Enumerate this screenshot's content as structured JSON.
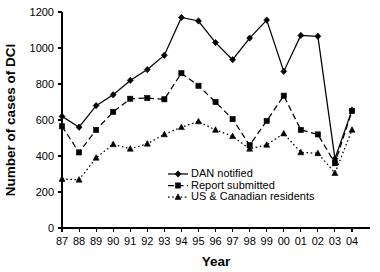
{
  "chart_data": {
    "type": "line",
    "title": "",
    "xlabel": "Year",
    "ylabel": "Number of cases of DCI",
    "categories": [
      "87",
      "88",
      "89",
      "90",
      "91",
      "92",
      "93",
      "94",
      "95",
      "96",
      "97",
      "98",
      "99",
      "00",
      "01",
      "02",
      "03",
      "04"
    ],
    "ylim": [
      0,
      1200
    ],
    "yticks": [
      0,
      200,
      400,
      600,
      800,
      1000,
      1200
    ],
    "grid": false,
    "legend_position": "inside-bottom-right",
    "series": [
      {
        "name": "DAN notified",
        "line_style": "solid",
        "marker": "diamond",
        "color": "#000000",
        "values": [
          620,
          560,
          680,
          740,
          820,
          880,
          960,
          1170,
          1150,
          1030,
          935,
          1055,
          1155,
          870,
          1070,
          1065,
          385,
          655
        ]
      },
      {
        "name": "Report submitted",
        "line_style": "dashed",
        "marker": "square",
        "color": "#000000",
        "values": [
          565,
          420,
          545,
          645,
          718,
          722,
          715,
          860,
          790,
          700,
          605,
          460,
          595,
          735,
          545,
          520,
          360,
          650
        ]
      },
      {
        "name": "US & Canadian residents",
        "line_style": "dotted",
        "marker": "triangle",
        "color": "#000000",
        "values": [
          272,
          268,
          390,
          465,
          440,
          468,
          520,
          560,
          592,
          545,
          510,
          440,
          462,
          525,
          420,
          415,
          305,
          545
        ]
      }
    ]
  },
  "legend": {
    "entries": [
      {
        "label": "DAN notified"
      },
      {
        "label": "Report submitted"
      },
      {
        "label": "US & Canadian residents"
      }
    ]
  }
}
